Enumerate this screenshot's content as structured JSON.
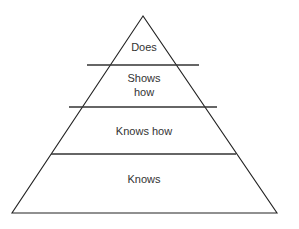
{
  "diagram": {
    "type": "pyramid",
    "levels_top_to_bottom": [
      {
        "id": "does",
        "label_lines": [
          "Does"
        ]
      },
      {
        "id": "shows-how",
        "label_lines": [
          "Shows",
          "how"
        ]
      },
      {
        "id": "knows-how",
        "label_lines": [
          "Knows how"
        ]
      },
      {
        "id": "knows",
        "label_lines": [
          "Knows"
        ]
      }
    ]
  },
  "colors": {
    "line": "#222222",
    "text": "#333333",
    "background": "#ffffff"
  }
}
